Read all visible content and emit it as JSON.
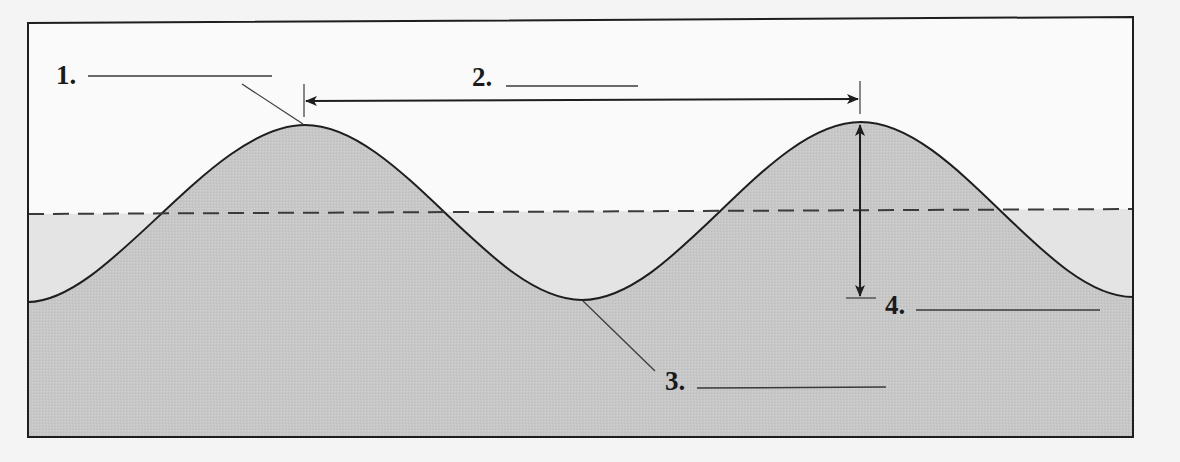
{
  "diagram": {
    "type": "wave-anatomy",
    "colors": {
      "background": "#f4f4f4",
      "frame_fill": "#fafafa",
      "water_fill": "#c9c9c9",
      "still_water_fill": "#e3e3e3",
      "line": "#1e1e1e",
      "dashed_line": "#3a3a3a"
    },
    "labels": [
      {
        "id": "1",
        "text": "1.",
        "answer_blank": "",
        "points_to": "wave-crest"
      },
      {
        "id": "2",
        "text": "2.",
        "answer_blank": "",
        "points_to": "crest-to-crest-distance"
      },
      {
        "id": "3",
        "text": "3.",
        "answer_blank": "",
        "points_to": "wave-trough"
      },
      {
        "id": "4",
        "text": "4.",
        "answer_blank": "",
        "points_to": "trough-to-crest-height"
      }
    ],
    "still_water_line": {
      "style": "dashed"
    }
  }
}
